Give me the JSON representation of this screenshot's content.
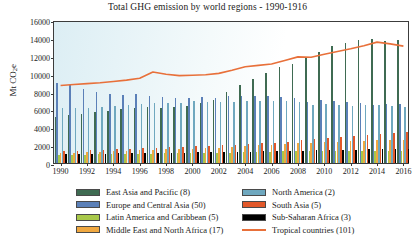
{
  "chart_data": {
    "type": "bar",
    "title": "Total GHG emission by world regions - 1990-1916",
    "xlabel": "",
    "ylabel": "Mt CO",
    "ylabel_sub": "2",
    "ylabel_suffix": "e",
    "ylim": [
      0,
      16000
    ],
    "ytick_values": [
      0,
      2000,
      4000,
      6000,
      8000,
      10000,
      12000,
      14000,
      16000
    ],
    "ytick_labels": [
      "0",
      "2000",
      "4000",
      "6000",
      "8000",
      "10000",
      "12000",
      "14000",
      "16000"
    ],
    "grid": false,
    "legend_position": "below",
    "x": [
      1990,
      1991,
      1992,
      1993,
      1994,
      1995,
      1996,
      1997,
      1998,
      1999,
      2000,
      2001,
      2002,
      2003,
      2004,
      2005,
      2006,
      2007,
      2008,
      2009,
      2010,
      2011,
      2012,
      2013,
      2014,
      2015,
      2016
    ],
    "xtick_labels": [
      "1990",
      "1992",
      "1994",
      "1996",
      "1998",
      "2000",
      "2002",
      "2004",
      "2006",
      "2008",
      "2010",
      "2012",
      "2014",
      "2016"
    ],
    "xtick_values": [
      1990,
      1992,
      1994,
      1996,
      1998,
      2000,
      2002,
      2004,
      2006,
      2008,
      2010,
      2012,
      2014,
      2016
    ],
    "series": [
      {
        "name": "East Asia and Pacific (8)",
        "color": "#3f6b52",
        "type": "bar",
        "values": [
          5200,
          5350,
          5450,
          5700,
          5800,
          6000,
          6200,
          6250,
          6200,
          6250,
          6400,
          6700,
          7100,
          7900,
          8700,
          9400,
          10100,
          10700,
          11100,
          11700,
          12400,
          13100,
          13400,
          13800,
          13900,
          13700,
          13800
        ]
      },
      {
        "name": "Europe and Central Asia (50)",
        "color": "#5b80b8",
        "type": "bar",
        "values": [
          9000,
          8700,
          8300,
          8000,
          7700,
          7650,
          7750,
          7550,
          7400,
          7300,
          7300,
          7350,
          7300,
          7450,
          7500,
          7450,
          7450,
          7400,
          7300,
          6850,
          7050,
          6950,
          6800,
          6700,
          6500,
          6550,
          6600
        ]
      },
      {
        "name": "Latin America and Caribbean (5)",
        "color": "#a8c84a",
        "type": "bar",
        "values": [
          900,
          920,
          940,
          960,
          990,
          1010,
          1040,
          1060,
          1090,
          1100,
          1120,
          1130,
          1150,
          1170,
          1200,
          1230,
          1260,
          1290,
          1320,
          1300,
          1340,
          1360,
          1380,
          1400,
          1390,
          1380,
          1380
        ]
      },
      {
        "name": "Middle East and North Africa (17)",
        "color": "#f0a840",
        "type": "bar",
        "values": [
          1100,
          1160,
          1220,
          1260,
          1310,
          1360,
          1420,
          1470,
          1520,
          1560,
          1610,
          1670,
          1730,
          1810,
          1890,
          1970,
          2040,
          2130,
          2200,
          2250,
          2330,
          2390,
          2460,
          2500,
          2530,
          2550,
          2580
        ]
      },
      {
        "name": "North America (2)",
        "color": "#6fa8bf",
        "type": "bar",
        "values": [
          6100,
          6100,
          6200,
          6300,
          6400,
          6450,
          6600,
          6700,
          6700,
          6750,
          6900,
          6800,
          6800,
          6850,
          6950,
          6950,
          6900,
          6950,
          6800,
          6450,
          6600,
          6500,
          6350,
          6450,
          6450,
          6350,
          6250
        ]
      },
      {
        "name": "South Asia (5)",
        "color": "#e2582a",
        "type": "bar",
        "values": [
          1300,
          1360,
          1410,
          1470,
          1530,
          1600,
          1660,
          1710,
          1760,
          1840,
          1880,
          1920,
          1970,
          2030,
          2110,
          2200,
          2290,
          2400,
          2520,
          2650,
          2770,
          2870,
          3000,
          3100,
          3250,
          3330,
          3420
        ]
      },
      {
        "name": "Sub-Saharan Africa (3)",
        "color": "#000000",
        "type": "bar",
        "values": [
          1000,
          1020,
          1040,
          1050,
          1070,
          1090,
          1110,
          1130,
          1150,
          1160,
          1180,
          1200,
          1220,
          1250,
          1280,
          1310,
          1340,
          1370,
          1400,
          1420,
          1450,
          1480,
          1510,
          1540,
          1560,
          1580,
          1600
        ]
      },
      {
        "name": "Tropical countries (101)",
        "color": "#e8703a",
        "type": "line",
        "values": [
          8900,
          9000,
          9100,
          9200,
          9350,
          9500,
          9700,
          10400,
          10150,
          10000,
          10050,
          10100,
          10250,
          10600,
          11000,
          11150,
          11300,
          11700,
          12100,
          12050,
          12400,
          12700,
          13000,
          13350,
          13750,
          13550,
          13300
        ]
      }
    ],
    "legend_entries": [
      {
        "label": "East Asia and Pacific (8)",
        "color": "#3f6b52",
        "marker": "swatch"
      },
      {
        "label": "North America (2)",
        "color": "#6fa8bf",
        "marker": "swatch"
      },
      {
        "label": "Europe and Central Asia (50)",
        "color": "#5b80b8",
        "marker": "swatch"
      },
      {
        "label": "South Asia (5)",
        "color": "#e2582a",
        "marker": "swatch"
      },
      {
        "label": "Latin America and Caribbean (5)",
        "color": "#a8c84a",
        "marker": "swatch"
      },
      {
        "label": "Sub-Saharan Africa (3)",
        "color": "#000000",
        "marker": "swatch"
      },
      {
        "label": "Middle East and North Africa (17)",
        "color": "#f0a840",
        "marker": "swatch"
      },
      {
        "label": "Tropical countries (101)",
        "color": "#e8703a",
        "marker": "line"
      }
    ]
  }
}
